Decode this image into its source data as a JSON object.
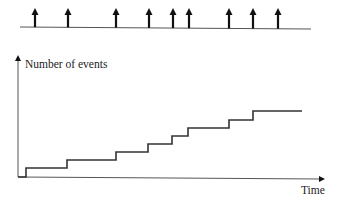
{
  "diagram": {
    "event_timeline": {
      "line": {
        "x1": 20,
        "y1": 27,
        "x2": 311,
        "y2": 29
      },
      "arrow_x": [
        35,
        68,
        116,
        149,
        173,
        189,
        229,
        253,
        278
      ],
      "arrow_color": "#111111"
    },
    "counting_plot": {
      "y_axis_label": "Number of events",
      "x_axis_label": "Time",
      "origin": {
        "x": 18,
        "y": 177
      },
      "y_axis_top": 55,
      "x_axis_right": 325,
      "steps": [
        {
          "x": 18,
          "y": 177
        },
        {
          "x": 26,
          "y": 168
        },
        {
          "x": 67,
          "y": 160
        },
        {
          "x": 116,
          "y": 152
        },
        {
          "x": 148,
          "y": 144
        },
        {
          "x": 172,
          "y": 136
        },
        {
          "x": 188,
          "y": 128
        },
        {
          "x": 229,
          "y": 120
        },
        {
          "x": 253,
          "y": 111
        }
      ],
      "end_x": 302,
      "line_color": "#333333",
      "axis_color": "#555555"
    }
  },
  "chart_data": {
    "type": "line",
    "title": "",
    "xlabel": "Time",
    "ylabel": "Number of events",
    "x": [
      0,
      1,
      2,
      3,
      4,
      5,
      6,
      7,
      8,
      9
    ],
    "series": [
      {
        "name": "N(t) step function",
        "values": [
          0,
          1,
          2,
          3,
          4,
          5,
          6,
          7,
          8,
          9
        ]
      }
    ],
    "event_times_relative": [
      35,
      68,
      116,
      149,
      173,
      189,
      229,
      253,
      278
    ]
  }
}
